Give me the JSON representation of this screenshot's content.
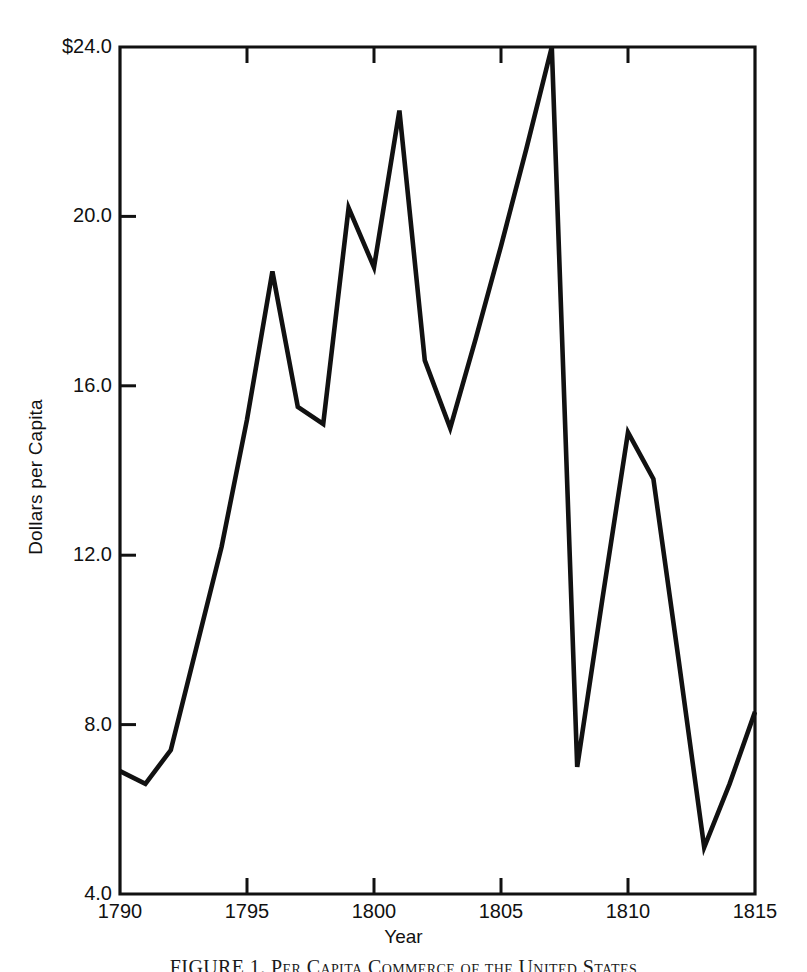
{
  "chart_data": {
    "type": "line",
    "title": "",
    "xlabel": "Year",
    "ylabel": "Dollars per Capita",
    "xlim": [
      1790,
      1815
    ],
    "ylim": [
      4.0,
      24.0
    ],
    "grid": false,
    "legend": null,
    "x_ticks": [
      1790,
      1795,
      1800,
      1805,
      1810,
      1815
    ],
    "x_tick_labels": [
      "1790",
      "1795",
      "1800",
      "1805",
      "1810",
      "1815"
    ],
    "y_ticks": [
      4.0,
      8.0,
      12.0,
      16.0,
      20.0,
      24.0
    ],
    "y_tick_labels": [
      "4.0",
      "8.0",
      "12.0",
      "16.0",
      "20.0",
      "$24.0"
    ],
    "x": [
      1790,
      1791,
      1792,
      1793,
      1794,
      1795,
      1796,
      1797,
      1798,
      1799,
      1800,
      1801,
      1802,
      1803,
      1804,
      1805,
      1806,
      1807,
      1808,
      1809,
      1810,
      1811,
      1812,
      1813,
      1814,
      1815
    ],
    "series": [
      {
        "name": "Per Capita Commerce",
        "color": "#111111",
        "values": [
          6.9,
          6.6,
          7.4,
          9.8,
          12.2,
          15.2,
          18.7,
          15.5,
          15.1,
          20.2,
          18.8,
          22.5,
          16.6,
          15.0,
          17.1,
          19.3,
          21.6,
          24.0,
          7.0,
          11.0,
          14.9,
          13.8,
          9.5,
          5.1,
          6.6,
          8.3
        ]
      }
    ]
  },
  "axis": {
    "y_title": "Dollars per Capita",
    "x_title": "Year"
  },
  "caption": {
    "text": "FIGURE 1.  Per Capita Commerce of the United States"
  }
}
